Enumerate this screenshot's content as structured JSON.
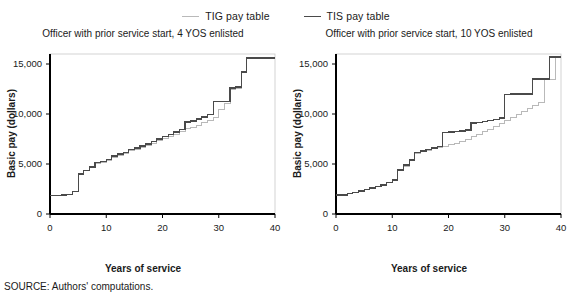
{
  "figure": {
    "source_note": "SOURCE: Authors' computations.",
    "colors": {
      "tig": "#b9b9b9",
      "tis": "#4a4a4a",
      "axis": "#000000",
      "background": "#ffffff"
    }
  },
  "legend": {
    "position": "top-center",
    "items": [
      {
        "label": "TIG pay table",
        "color": "#b9b9b9",
        "key": "tig"
      },
      {
        "label": "TIS pay table",
        "color": "#4a4a4a",
        "key": "tis"
      }
    ]
  },
  "axes": {
    "xlabel": "Years of service",
    "ylabel": "Basic pay (dollars)",
    "xticks": [
      "0",
      "10",
      "20",
      "30",
      "40"
    ],
    "yticks": [
      "0",
      "5,000",
      "10,000",
      "15,000"
    ]
  },
  "chart_data": [
    {
      "type": "line",
      "subtype": "step",
      "title": "Officer with prior service start, 4 YOS enlisted",
      "xlabel": "Years of service",
      "ylabel": "Basic pay (dollars)",
      "xlim": [
        0,
        40
      ],
      "ylim": [
        0,
        16000
      ],
      "xticks": [
        0,
        10,
        20,
        30,
        40
      ],
      "yticks": [
        0,
        5000,
        10000,
        15000
      ],
      "grid": false,
      "legend_position": "top-center (shared)",
      "x": [
        0,
        1,
        2,
        3,
        4,
        5,
        6,
        7,
        8,
        9,
        10,
        11,
        12,
        13,
        14,
        15,
        16,
        17,
        18,
        19,
        20,
        21,
        22,
        23,
        24,
        25,
        26,
        27,
        28,
        29,
        30,
        31,
        32,
        33,
        34,
        35,
        36,
        37,
        38,
        39,
        40
      ],
      "series": [
        {
          "name": "TIG pay table",
          "color": "#b9b9b9",
          "values": [
            1850,
            1850,
            1900,
            1950,
            2250,
            4000,
            4350,
            4700,
            5100,
            5200,
            5350,
            5700,
            5900,
            6050,
            6350,
            6500,
            6700,
            6900,
            7100,
            7350,
            7600,
            7800,
            8000,
            8250,
            8550,
            8700,
            8900,
            9150,
            9400,
            9700,
            10500,
            11050,
            12450,
            12600,
            14150,
            15550,
            15600,
            15600,
            15600,
            15600,
            15600
          ]
        },
        {
          "name": "TIS pay table",
          "color": "#4a4a4a",
          "values": [
            1850,
            1850,
            1900,
            1950,
            2250,
            4000,
            4350,
            4700,
            5150,
            5250,
            5450,
            5800,
            6000,
            6150,
            6450,
            6600,
            6800,
            7000,
            7250,
            7500,
            7750,
            7950,
            8200,
            8450,
            9200,
            9300,
            9500,
            9700,
            9950,
            11250,
            11250,
            11250,
            12600,
            12700,
            14200,
            15600,
            15600,
            15600,
            15600,
            15600,
            15600
          ]
        }
      ]
    },
    {
      "type": "line",
      "subtype": "step",
      "title": "Officer with prior service start, 10 YOS enlisted",
      "xlabel": "Years of service",
      "ylabel": "Basic pay (dollars)",
      "xlim": [
        0,
        40
      ],
      "ylim": [
        0,
        16000
      ],
      "xticks": [
        0,
        10,
        20,
        30,
        40
      ],
      "yticks": [
        0,
        5000,
        10000,
        15000
      ],
      "grid": false,
      "legend_position": "top-center (shared)",
      "x": [
        0,
        1,
        2,
        3,
        4,
        5,
        6,
        7,
        8,
        9,
        10,
        11,
        12,
        13,
        14,
        15,
        16,
        17,
        18,
        19,
        20,
        21,
        22,
        23,
        24,
        25,
        26,
        27,
        28,
        29,
        30,
        31,
        32,
        33,
        34,
        35,
        36,
        37,
        38,
        39,
        40
      ],
      "series": [
        {
          "name": "TIG pay table",
          "color": "#b9b9b9",
          "values": [
            1900,
            1900,
            2050,
            2150,
            2300,
            2450,
            2600,
            2750,
            2900,
            3150,
            3400,
            4350,
            4800,
            5350,
            6100,
            6250,
            6400,
            6550,
            6700,
            6800,
            6950,
            7100,
            7250,
            7450,
            7750,
            8000,
            8250,
            8500,
            8800,
            9100,
            9400,
            9700,
            10000,
            10300,
            10600,
            10900,
            11150,
            13500,
            13500,
            15700,
            15700
          ]
        },
        {
          "name": "TIS pay table",
          "color": "#4a4a4a",
          "values": [
            1900,
            1900,
            2050,
            2150,
            2300,
            2450,
            2600,
            2750,
            2900,
            3150,
            3400,
            4400,
            4900,
            5400,
            6150,
            6300,
            6450,
            6600,
            6750,
            8150,
            8200,
            8250,
            8300,
            8400,
            9100,
            9150,
            9250,
            9350,
            9450,
            9600,
            11950,
            12000,
            12000,
            12000,
            12000,
            13500,
            13500,
            13500,
            15700,
            15700,
            15700
          ]
        }
      ]
    }
  ]
}
